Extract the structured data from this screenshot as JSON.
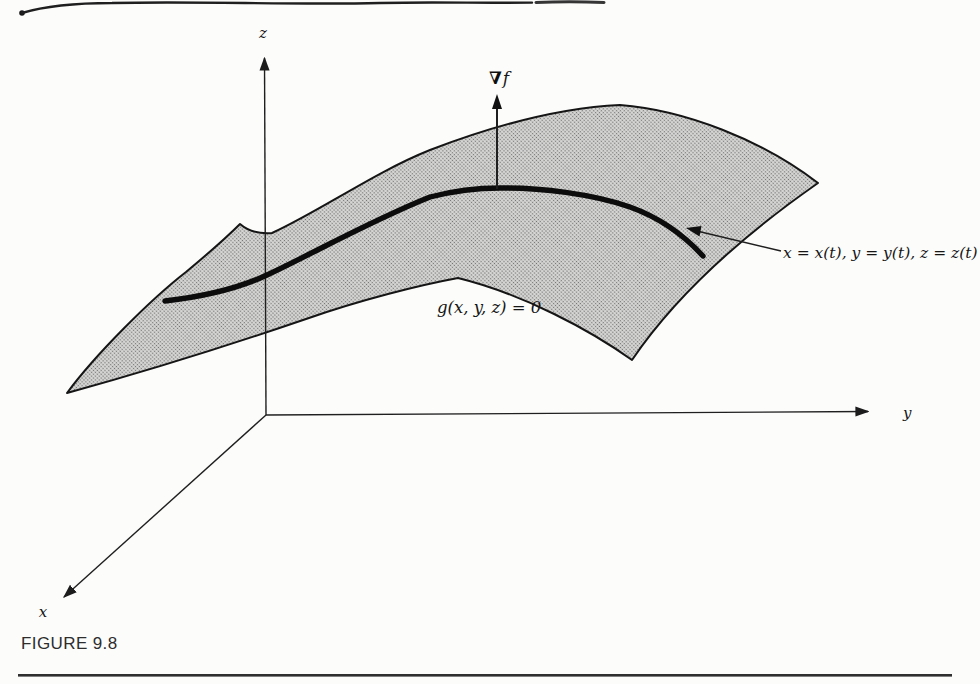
{
  "page": {
    "background": "#fcfcfb",
    "caption": "FIGURE 9.8"
  },
  "diagram": {
    "axes": {
      "x": "x",
      "y": "y",
      "z": "z"
    },
    "gradient_label": {
      "nabla": "∇",
      "f": "f"
    },
    "curve_label": "x = x(t), y = y(t), z = z(t)",
    "surface_label": "g(x, y, z) = 0",
    "colors": {
      "ink": "#1c1c1c",
      "surface_base": "#d8d8d6",
      "surface_dot": "#707070",
      "caption_ink": "#2d2d2d"
    }
  }
}
